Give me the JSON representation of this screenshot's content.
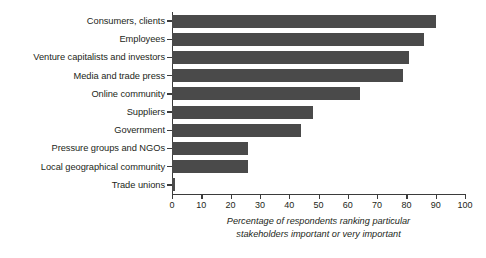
{
  "chart_data": {
    "type": "bar",
    "orientation": "horizontal",
    "title": "",
    "subtitle": "",
    "xlabel": "Percentage of respondents ranking particular stakeholders important or very important",
    "ylabel": "",
    "xlim": [
      0,
      100
    ],
    "xticks": [
      0,
      10,
      20,
      30,
      40,
      50,
      60,
      70,
      80,
      90,
      100
    ],
    "xtick_labels": [
      "0",
      "10",
      "20",
      "30",
      "40",
      "50",
      "60",
      "70",
      "80",
      "90",
      "100"
    ],
    "grid": false,
    "legend": null,
    "bar_color": "#4a4a4a",
    "axis_color": "#3b3b3b",
    "text_color": "#231f20",
    "background": "#ffffff",
    "categories": [
      "Consumers, clients",
      "Employees",
      "Venture capitalists and investors",
      "Media and trade press",
      "Online community",
      "Suppliers",
      "Government",
      "Pressure groups and NGOs",
      "Local geographical community",
      "Trade unions"
    ],
    "values": [
      90,
      86,
      81,
      79,
      64,
      48,
      44,
      26,
      26,
      1
    ],
    "series": [
      {
        "name": "Percentage of respondents ranking particular stakeholders important or very important",
        "values": [
          90,
          86,
          81,
          79,
          64,
          48,
          44,
          26,
          26,
          1
        ]
      }
    ]
  },
  "caption": {
    "line1": "Percentage of respondents ranking particular",
    "line2": "stakeholders important or very important"
  }
}
